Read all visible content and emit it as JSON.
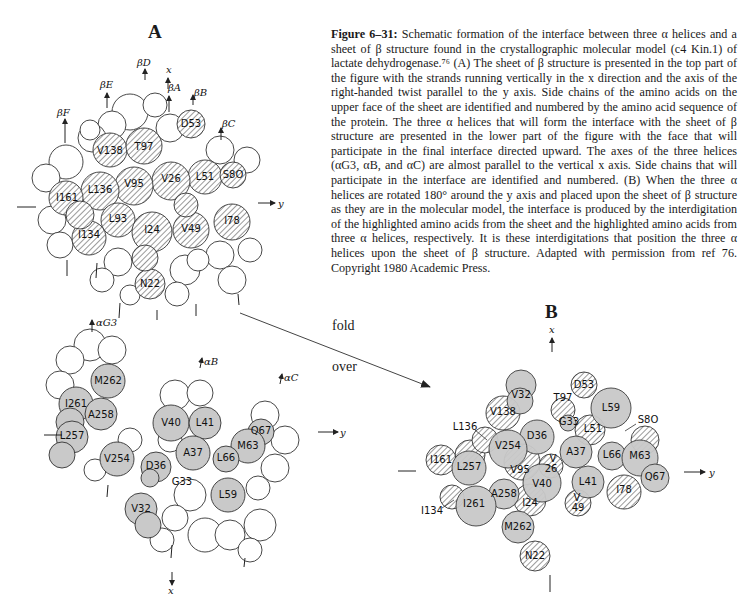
{
  "caption": {
    "figure_label": "Figure 6–31:",
    "text": " Schematic formation of the interface between three α helices and a sheet of β structure found in the crystallographic molecular model (c4 Kin.1) of lactate dehydrogenase.⁷⁶ (A) The sheet of β structure is presented in the top part of the figure with the strands running vertically in the x direction and the axis of the right-handed twist parallel to the y axis. Side chains of the amino acids on the upper face of the sheet are identified and numbered by the amino acid sequence of the protein. The three α helices that will form the interface with the sheet of β structure are presented in the lower part of the figure with the face that will participate in the final interface directed upward. The axes of the three helices (αG3, αB, and αC) are almost parallel to the vertical x axis. Side chains that will participate in the interface are identified and numbered. (B) When the three α helices are rotated 180° around the y axis and placed upon the sheet of β structure as they are in the molecular model, the interface is produced by the interdigitation of the highlighted amino acids from the sheet and the highlighted amino acids from three α helices, respectively. It is these interdigitations that position the three α helices upon the sheet of β structure. Adapted with permission from ref 76. Copyright 1980 Academic Press."
  },
  "panels": {
    "A": {
      "title": "A",
      "sheet": {
        "strand_labels": [
          "βF",
          "βE",
          "βD",
          "βA",
          "βB",
          "βC"
        ],
        "axis_labels": {
          "x": "x",
          "y": "y"
        },
        "residues": [
          {
            "label": "D53",
            "x": 191,
            "y": 124
          },
          {
            "label": "V138",
            "x": 110,
            "y": 150
          },
          {
            "label": "T97",
            "x": 144,
            "y": 146
          },
          {
            "label": "L51",
            "x": 205,
            "y": 177
          },
          {
            "label": "S8O",
            "x": 233,
            "y": 175
          },
          {
            "label": "V26",
            "x": 171,
            "y": 179
          },
          {
            "label": "V95",
            "x": 134,
            "y": 184
          },
          {
            "label": "L136",
            "x": 100,
            "y": 190
          },
          {
            "label": "I161",
            "x": 67,
            "y": 198
          },
          {
            "label": "L93",
            "x": 118,
            "y": 218
          },
          {
            "label": "I24",
            "x": 152,
            "y": 229
          },
          {
            "label": "V49",
            "x": 191,
            "y": 228
          },
          {
            "label": "I78",
            "x": 232,
            "y": 220
          },
          {
            "label": "I134",
            "x": 89,
            "y": 235
          },
          {
            "label": "N22",
            "x": 150,
            "y": 284
          }
        ]
      },
      "helices": {
        "helix_labels": [
          "αG3",
          "αB",
          "αC"
        ],
        "axis_labels": {
          "x": "x",
          "y": "y"
        },
        "residues": [
          {
            "label": "M262",
            "x": 108,
            "y": 382
          },
          {
            "label": "I261",
            "x": 76,
            "y": 404
          },
          {
            "label": "A258",
            "x": 101,
            "y": 415
          },
          {
            "label": "V40",
            "x": 171,
            "y": 422
          },
          {
            "label": "L41",
            "x": 205,
            "y": 423
          },
          {
            "label": "L257",
            "x": 72,
            "y": 435
          },
          {
            "label": "Q67",
            "x": 261,
            "y": 431
          },
          {
            "label": "M63",
            "x": 248,
            "y": 446
          },
          {
            "label": "A37",
            "x": 193,
            "y": 452
          },
          {
            "label": "L66",
            "x": 226,
            "y": 458
          },
          {
            "label": "V254",
            "x": 117,
            "y": 458
          },
          {
            "label": "D36",
            "x": 156,
            "y": 467
          },
          {
            "label": "G33",
            "x": 182,
            "y": 481
          },
          {
            "label": "L59",
            "x": 228,
            "y": 495
          },
          {
            "label": "V32",
            "x": 141,
            "y": 509
          }
        ]
      }
    },
    "transition": {
      "line1": "fold",
      "line2": "over"
    },
    "B": {
      "title": "B",
      "axis_labels": {
        "x": "x",
        "y": "y"
      },
      "residues": [
        {
          "label": "D53",
          "x": 584,
          "y": 385,
          "type": "sheet"
        },
        {
          "label": "V32",
          "x": 520,
          "y": 395,
          "type": "helix"
        },
        {
          "label": "T97",
          "x": 563,
          "y": 398,
          "type": "sheet"
        },
        {
          "label": "L59",
          "x": 611,
          "y": 408,
          "type": "helix"
        },
        {
          "label": "V138",
          "x": 503,
          "y": 412,
          "type": "sheet"
        },
        {
          "label": "S8O",
          "x": 645,
          "y": 420,
          "type": "sheet"
        },
        {
          "label": "G33",
          "x": 567,
          "y": 422,
          "type": "helix"
        },
        {
          "label": "L136",
          "x": 465,
          "y": 427,
          "type": "sheet"
        },
        {
          "label": "L51",
          "x": 593,
          "y": 429,
          "type": "sheet"
        },
        {
          "label": "D36",
          "x": 536,
          "y": 436,
          "type": "helix"
        },
        {
          "label": "V254",
          "x": 507,
          "y": 446,
          "type": "helix"
        },
        {
          "label": "A37",
          "x": 575,
          "y": 452,
          "type": "helix"
        },
        {
          "label": "L66",
          "x": 613,
          "y": 455,
          "type": "helix"
        },
        {
          "label": "M63",
          "x": 639,
          "y": 456,
          "type": "helix"
        },
        {
          "label": "I161",
          "x": 441,
          "y": 460,
          "type": "sheet"
        },
        {
          "label": "L257",
          "x": 469,
          "y": 467,
          "type": "helix"
        },
        {
          "label": "V95",
          "x": 520,
          "y": 470,
          "type": "sheet"
        },
        {
          "label": "V26",
          "x": 551,
          "y": 462,
          "type": "sheet"
        },
        {
          "label": "V40",
          "x": 541,
          "y": 484,
          "type": "helix"
        },
        {
          "label": "L41",
          "x": 587,
          "y": 482,
          "type": "helix"
        },
        {
          "label": "Q67",
          "x": 655,
          "y": 477,
          "type": "helix"
        },
        {
          "label": "I78",
          "x": 624,
          "y": 490,
          "type": "sheet"
        },
        {
          "label": "A258",
          "x": 504,
          "y": 494,
          "type": "helix"
        },
        {
          "label": "I261",
          "x": 474,
          "y": 504,
          "type": "helix"
        },
        {
          "label": "I24",
          "x": 530,
          "y": 503,
          "type": "sheet"
        },
        {
          "label": "V49",
          "x": 578,
          "y": 500,
          "type": "sheet"
        },
        {
          "label": "I134",
          "x": 432,
          "y": 511,
          "type": "sheet"
        },
        {
          "label": "M262",
          "x": 518,
          "y": 527,
          "type": "helix"
        },
        {
          "label": "N22",
          "x": 535,
          "y": 556,
          "type": "sheet"
        }
      ]
    }
  },
  "colors": {
    "helix_fill": "#c9c9c9",
    "sheet_hatch": "#555555",
    "outline": "#333333"
  }
}
